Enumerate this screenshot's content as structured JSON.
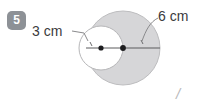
{
  "question": {
    "number": "5",
    "badge_color": "#8d9196"
  },
  "labels": {
    "inner_radius": "3 cm",
    "outer_radius": "6 cm"
  },
  "corner": {
    "mark": "/"
  },
  "figure": {
    "name": "two-tangent-circles-diagram",
    "fill_color": "#d6d6d8",
    "stroke_color": "#b0b0b2",
    "line_color": "#5a5a5c",
    "inner_fill": "#ffffff",
    "large_circle": {
      "cx": 123,
      "cy": 48,
      "r": 37
    },
    "small_circle": {
      "cx": 101,
      "cy": 48,
      "r": 22
    }
  }
}
